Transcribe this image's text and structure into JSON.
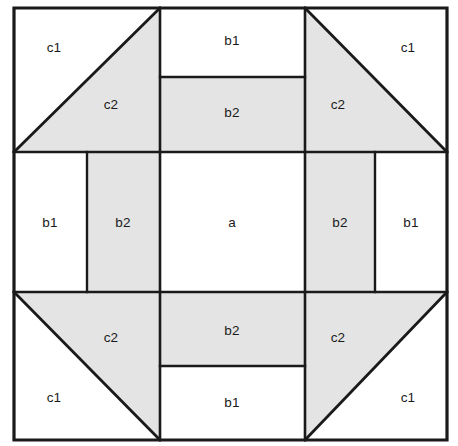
{
  "figure": {
    "type": "geometric-dissection-diagram",
    "canvas": {
      "width": 458,
      "height": 446
    },
    "colors": {
      "background": "#ffffff",
      "shaded_fill": "#e4e4e4",
      "unshaded_fill": "#ffffff",
      "line": "#1a1a1a"
    },
    "outer_square": {
      "x": 14,
      "y": 8,
      "width": 433,
      "height": 432
    },
    "grid": {
      "vertical_lines": [
        160,
        305
      ],
      "horizontal_lines": [
        152,
        292
      ],
      "inner_vertical_lines": [
        87,
        375
      ],
      "inner_horizontal_lines": [
        77,
        366
      ]
    },
    "pieces": [
      {
        "id": "c1-top-left",
        "label": "c1",
        "shape": "right-triangle",
        "shaded": false,
        "points": "14,8 160,8 14,152",
        "label_x": 54,
        "label_y": 48
      },
      {
        "id": "c2-top-left",
        "label": "c2",
        "shape": "right-triangle",
        "shaded": true,
        "points": "160,8 160,152 14,152",
        "label_x": 111,
        "label_y": 105
      },
      {
        "id": "b1-top",
        "label": "b1",
        "shape": "rectangle",
        "shaded": false,
        "points": "160,8 305,8 305,77 160,77",
        "label_x": 232,
        "label_y": 41
      },
      {
        "id": "b2-top",
        "label": "b2",
        "shape": "rectangle",
        "shaded": true,
        "points": "160,77 305,77 305,152 160,152",
        "label_x": 232,
        "label_y": 113
      },
      {
        "id": "c1-top-right",
        "label": "c1",
        "shape": "right-triangle",
        "shaded": false,
        "points": "305,8 447,8 447,152",
        "label_x": 408,
        "label_y": 48
      },
      {
        "id": "c2-top-right",
        "label": "c2",
        "shape": "right-triangle",
        "shaded": true,
        "points": "305,8 447,152 305,152",
        "label_x": 338,
        "label_y": 105
      },
      {
        "id": "b1-left",
        "label": "b1",
        "shape": "rectangle",
        "shaded": false,
        "points": "14,152 87,152 87,292 14,292",
        "label_x": 50,
        "label_y": 223
      },
      {
        "id": "b2-left",
        "label": "b2",
        "shape": "rectangle",
        "shaded": true,
        "points": "87,152 160,152 160,292 87,292",
        "label_x": 123,
        "label_y": 223
      },
      {
        "id": "a-center",
        "label": "a",
        "shape": "square",
        "shaded": false,
        "points": "160,152 305,152 305,292 160,292",
        "label_x": 232,
        "label_y": 223
      },
      {
        "id": "b2-right",
        "label": "b2",
        "shape": "rectangle",
        "shaded": true,
        "points": "305,152 375,152 375,292 305,292",
        "label_x": 340,
        "label_y": 223
      },
      {
        "id": "b1-right",
        "label": "b1",
        "shape": "rectangle",
        "shaded": false,
        "points": "375,152 447,152 447,292 375,292",
        "label_x": 411,
        "label_y": 223
      },
      {
        "id": "c2-bottom-left",
        "label": "c2",
        "shape": "right-triangle",
        "shaded": true,
        "points": "14,292 160,292 160,440",
        "label_x": 111,
        "label_y": 338
      },
      {
        "id": "c1-bottom-left",
        "label": "c1",
        "shape": "right-triangle",
        "shaded": false,
        "points": "14,292 160,440 14,440",
        "label_x": 54,
        "label_y": 398
      },
      {
        "id": "b2-bottom",
        "label": "b2",
        "shape": "rectangle",
        "shaded": true,
        "points": "160,292 305,292 305,366 160,366",
        "label_x": 232,
        "label_y": 331
      },
      {
        "id": "b1-bottom",
        "label": "b1",
        "shape": "rectangle",
        "shaded": false,
        "points": "160,366 305,366 305,440 160,440",
        "label_x": 232,
        "label_y": 403
      },
      {
        "id": "c2-bottom-right",
        "label": "c2",
        "shape": "right-triangle",
        "shaded": true,
        "points": "305,292 447,292 305,440",
        "label_x": 338,
        "label_y": 338
      },
      {
        "id": "c1-bottom-right",
        "label": "c1",
        "shape": "right-triangle",
        "shaded": false,
        "points": "447,292 447,440 305,440",
        "label_x": 408,
        "label_y": 398
      }
    ],
    "edges": {
      "outer": [
        "M14,8 L447,8 L447,440 L14,440 Z"
      ],
      "main_grid": [
        "M14,152 L447,152",
        "M14,292 L447,292",
        "M160,8 L160,440",
        "M305,8 L305,440"
      ],
      "inner": [
        "M160,77 L305,77",
        "M160,366 L305,366",
        "M87,152 L87,292",
        "M375,152 L375,292"
      ],
      "diagonals": [
        "M14,152 L160,8",
        "M305,8 L447,152",
        "M14,292 L160,440",
        "M447,292 L305,440"
      ]
    }
  }
}
